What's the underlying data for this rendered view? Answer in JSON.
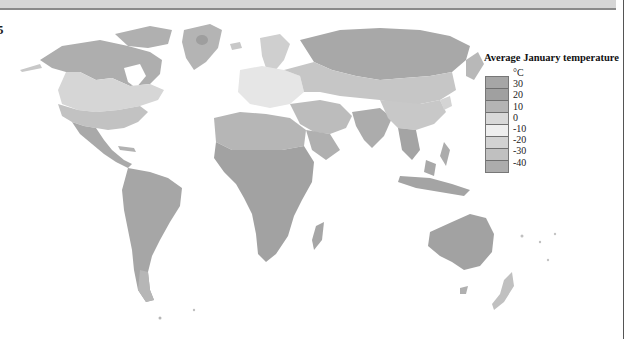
{
  "edge_text": "5",
  "legend": {
    "title": "Average January temperature",
    "unit": "°C",
    "classes": [
      {
        "label": "30",
        "color": "#a0a0a0"
      },
      {
        "label": "20",
        "color": "#a8a8a8"
      },
      {
        "label": "10",
        "color": "#b8b8b8"
      },
      {
        "label": "0",
        "color": "#dadada"
      },
      {
        "label": "-10",
        "color": "#efefef"
      },
      {
        "label": "-20",
        "color": "#d4d4d4"
      },
      {
        "label": "-30",
        "color": "#c0c0c0"
      },
      {
        "label": "-40",
        "color": "#acacac"
      }
    ],
    "top_swatch_color": "#a6a6a6"
  },
  "colors": {
    "band": "#d6d6d6",
    "land_hot": "#a3a3a3",
    "land_warm": "#b0b0b0",
    "land_mild": "#cbcbcb",
    "land_cool": "#dedede",
    "land_cold": "#c4c4c4",
    "land_frigid": "#a9a9a9",
    "ocean": "#ffffff"
  }
}
